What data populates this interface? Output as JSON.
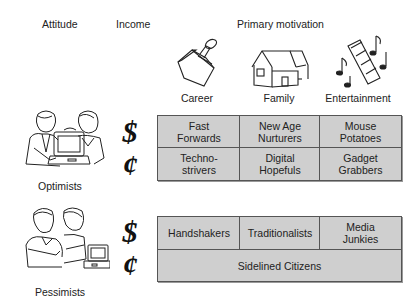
{
  "headers": {
    "attitude": "Attitude",
    "income": "Income",
    "motivation": "Primary motivation"
  },
  "motivations": [
    {
      "label": "Career",
      "icon": "briefcase-stamp-icon"
    },
    {
      "label": "Family",
      "icon": "house-icon"
    },
    {
      "label": "Entertainment",
      "icon": "film-music-icon"
    }
  ],
  "attitudes": [
    {
      "label": "Optimists",
      "icon": "optimists-people-computer-icon"
    },
    {
      "label": "Pessimists",
      "icon": "pessimists-people-computer-icon"
    }
  ],
  "income_symbols": {
    "high": "$",
    "low": "¢"
  },
  "optimists_grid": {
    "high_income": [
      "Fast\nForwards",
      "New Age\nNurturers",
      "Mouse\nPotatoes"
    ],
    "low_income": [
      "Techno-\nstrivers",
      "Digital\nHopefuls",
      "Gadget\nGrabbers"
    ]
  },
  "pessimists_grid": {
    "high_income": [
      "Handshakers",
      "Traditionalists",
      "Media\nJunkies"
    ],
    "low_income": "Sidelined Citizens"
  },
  "colors": {
    "cell_fill": "#cfcfcf",
    "border": "#555555"
  }
}
